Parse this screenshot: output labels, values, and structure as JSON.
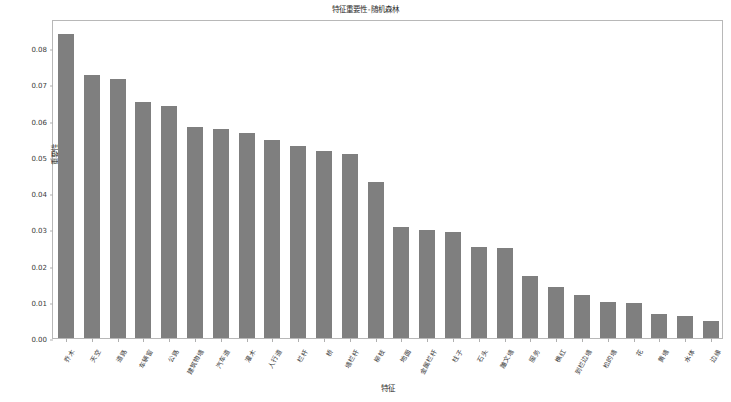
{
  "chart_data": {
    "type": "bar",
    "title": "特征重要性-随机森林",
    "xlabel": "特征",
    "ylabel": "重要性",
    "ylim": [
      0.0,
      0.088
    ],
    "ytick_values": [
      0.0,
      0.01,
      0.02,
      0.03,
      0.04,
      0.05,
      0.06,
      0.07,
      0.08
    ],
    "ytick_labels": [
      "0.00",
      "0.01",
      "0.02",
      "0.03",
      "0.04",
      "0.05",
      "0.06",
      "0.07",
      "0.08"
    ],
    "grid": false,
    "legend": null,
    "bar_color": "#7f7f7f",
    "categories": [
      "乔木",
      "天空",
      "道路",
      "车辆窗",
      "公路",
      "建筑物墙",
      "汽车道",
      "灌木",
      "人行道",
      "栏杆",
      "桥",
      "墙栏杆",
      "柳枝",
      "地面",
      "金属栏杆",
      "柱子",
      "石头",
      "雕文墙",
      "服务",
      "樵红",
      "到栏边墙",
      "松的墙",
      "花",
      "黄墙",
      "水体",
      "边缘"
    ],
    "values": [
      0.084,
      0.0725,
      0.0715,
      0.065,
      0.064,
      0.0583,
      0.0577,
      0.0565,
      0.0545,
      0.053,
      0.0515,
      0.0508,
      0.043,
      0.0307,
      0.0297,
      0.0293,
      0.025,
      0.0249,
      0.0172,
      0.0142,
      0.0119,
      0.0099,
      0.0097,
      0.0065,
      0.0061,
      0.0048
    ]
  },
  "figure": {
    "background_color": "#ffffff",
    "axes_edge_color": "#b8b8b8",
    "tick_color": "#b0b0b0",
    "text_color": "#3a3a3a"
  }
}
